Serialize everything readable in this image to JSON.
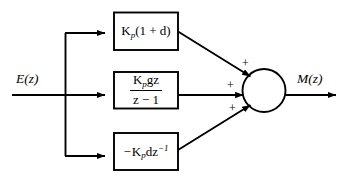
{
  "diagram": {
    "type": "control-block-diagram",
    "stroke_color": "#000000",
    "background_color": "#ffffff",
    "input": {
      "label_main": "E",
      "label_paren_open": "(",
      "label_arg": "z",
      "label_paren_close": ")",
      "label_full": "E(z)"
    },
    "output": {
      "label_main": "M",
      "label_paren_open": "(",
      "label_arg": "z",
      "label_paren_close": ")",
      "label_full": "M(z)"
    },
    "blocks": [
      {
        "id": "proportional",
        "name": "proportional-block",
        "expression": "K_p(1 + d)",
        "gain_symbol": "K",
        "gain_subscript": "p",
        "body": "(1 + d)"
      },
      {
        "id": "integral",
        "name": "integral-block",
        "expression": "K_p g z / (z - 1)",
        "numerator_gain": "K",
        "numerator_subscript": "p",
        "numerator_rest": "gz",
        "denominator": "z − 1"
      },
      {
        "id": "derivative",
        "name": "derivative-block",
        "expression": "- K_p d z^-1",
        "sign": "−",
        "gain_symbol": "K",
        "gain_subscript": "p",
        "body": "dz",
        "exponent": "−1"
      }
    ],
    "summing_junction": {
      "name": "summing-junction",
      "signs": [
        {
          "position": "upper-left",
          "symbol": "+"
        },
        {
          "position": "left",
          "symbol": "+"
        },
        {
          "position": "lower-left",
          "symbol": "+"
        }
      ]
    }
  }
}
